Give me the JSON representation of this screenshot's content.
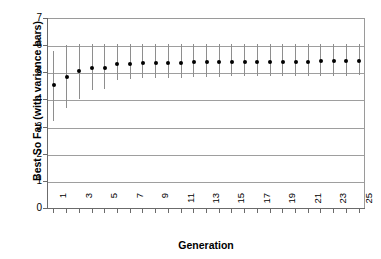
{
  "chart_data": {
    "type": "scatter",
    "title": "",
    "xlabel": "Generation",
    "ylabel": "Best So Far (with variance bars)",
    "xlim": [
      0.5,
      25.5
    ],
    "ylim": [
      0,
      7
    ],
    "grid": true,
    "legend": "none",
    "y_ticks": [
      0,
      1,
      2,
      3,
      4,
      5,
      6,
      7
    ],
    "y_tick_labels": [
      "0",
      "1",
      "2",
      "3",
      "4",
      "5",
      "6",
      "7"
    ],
    "x_ticks": [
      1,
      2,
      3,
      4,
      5,
      6,
      7,
      8,
      9,
      10,
      11,
      12,
      13,
      14,
      15,
      16,
      17,
      18,
      19,
      20,
      21,
      22,
      23,
      24,
      25
    ],
    "x_tick_labels": [
      "1",
      "",
      "3",
      "",
      "5",
      "",
      "7",
      "",
      "9",
      "",
      "11",
      "",
      "13",
      "",
      "15",
      "",
      "17",
      "",
      "19",
      "",
      "21",
      "",
      "23",
      "",
      "25"
    ],
    "categories": [
      1,
      2,
      3,
      4,
      5,
      6,
      7,
      8,
      9,
      10,
      11,
      12,
      13,
      14,
      15,
      16,
      17,
      18,
      19,
      20,
      21,
      22,
      23,
      24,
      25
    ],
    "values": [
      4.55,
      4.84,
      5.03,
      5.14,
      5.17,
      5.29,
      5.31,
      5.34,
      5.35,
      5.34,
      5.35,
      5.38,
      5.38,
      5.38,
      5.38,
      5.38,
      5.38,
      5.38,
      5.39,
      5.39,
      5.39,
      5.4,
      5.4,
      5.4,
      5.41
    ],
    "error_low": [
      3.2,
      3.68,
      4.0,
      4.35,
      4.37,
      4.72,
      4.75,
      4.78,
      4.8,
      4.8,
      4.8,
      4.84,
      4.84,
      4.84,
      4.85,
      4.85,
      4.85,
      4.86,
      4.86,
      4.86,
      4.87,
      4.87,
      4.88,
      4.88,
      4.89
    ],
    "error_high": [
      5.8,
      6.02,
      6.05,
      6.03,
      6.04,
      6.03,
      6.03,
      6.03,
      6.03,
      6.03,
      6.03,
      6.03,
      6.03,
      6.03,
      6.03,
      6.03,
      6.03,
      6.03,
      6.03,
      6.03,
      6.03,
      6.03,
      6.03,
      6.03,
      6.03
    ],
    "marker_color": "#000000",
    "errorbar_color": "#8e8e8e",
    "gridline_color": "#9e9e9e",
    "axis_color": "#6b6b6b",
    "plot_background": "#ffffff"
  }
}
